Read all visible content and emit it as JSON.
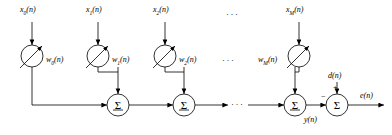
{
  "figure": {
    "stroke_color": "#000000",
    "background_color": "#ffffff"
  },
  "inputs": [
    {
      "name": "x0",
      "label_main": "x",
      "label_sub": "0",
      "label_suffix": "(n)",
      "x": 30,
      "y": 12
    },
    {
      "name": "x1",
      "label_main": "x",
      "label_sub": "1",
      "label_suffix": "(n)",
      "x": 96,
      "y": 12
    },
    {
      "name": "x2",
      "label_main": "x",
      "label_sub": "2",
      "label_suffix": "(n)",
      "x": 163,
      "y": 12
    },
    {
      "name": "xM",
      "label_main": "x",
      "label_sub": "M",
      "label_suffix": "(n)",
      "x": 297,
      "y": 12
    }
  ],
  "weights": [
    {
      "name": "w0",
      "label_main": "w",
      "label_sub": "0",
      "label_suffix": "(n)",
      "x": 46,
      "y": 60
    },
    {
      "name": "w1",
      "label_main": "w",
      "label_sub": "1",
      "label_suffix": "(n)",
      "x": 112,
      "y": 60
    },
    {
      "name": "w2",
      "label_main": "w",
      "label_sub": "2",
      "label_suffix": "(n)",
      "x": 179,
      "y": 60
    },
    {
      "name": "wM",
      "label_main": "w",
      "label_sub": "M",
      "label_suffix": "(n)",
      "x": 258,
      "y": 60
    }
  ],
  "summers": [
    {
      "name": "sum-1",
      "glyph": "Σ",
      "cx": 118,
      "cy": 105
    },
    {
      "name": "sum-2",
      "glyph": "Σ",
      "cx": 184,
      "cy": 105
    },
    {
      "name": "sum-3",
      "glyph": "Σ",
      "cx": 295,
      "cy": 105
    },
    {
      "name": "sum-error",
      "glyph": "Σ",
      "cx": 337,
      "cy": 105
    }
  ],
  "signals": {
    "desired": {
      "label_main": "d",
      "label_suffix": "(n)",
      "x": 330,
      "y": 76
    },
    "output": {
      "label_main": "y",
      "label_suffix": "(n)",
      "x": 307,
      "y": 120
    },
    "error": {
      "label_main": "e",
      "label_suffix": "(n)",
      "x": 362,
      "y": 96
    }
  },
  "signs": {
    "plus": "+",
    "minus": "−",
    "plus_x": 334,
    "plus_y": 87,
    "minus_x": 320,
    "minus_y": 96
  },
  "ellipses": [
    {
      "name": "ellipsis-inputs-top",
      "text": "···",
      "x": 232,
      "y": 14
    },
    {
      "name": "ellipsis-weights-row",
      "text": "···",
      "x": 228,
      "y": 60
    },
    {
      "name": "ellipsis-sum-row",
      "text": "···",
      "x": 237,
      "y": 100
    }
  ]
}
